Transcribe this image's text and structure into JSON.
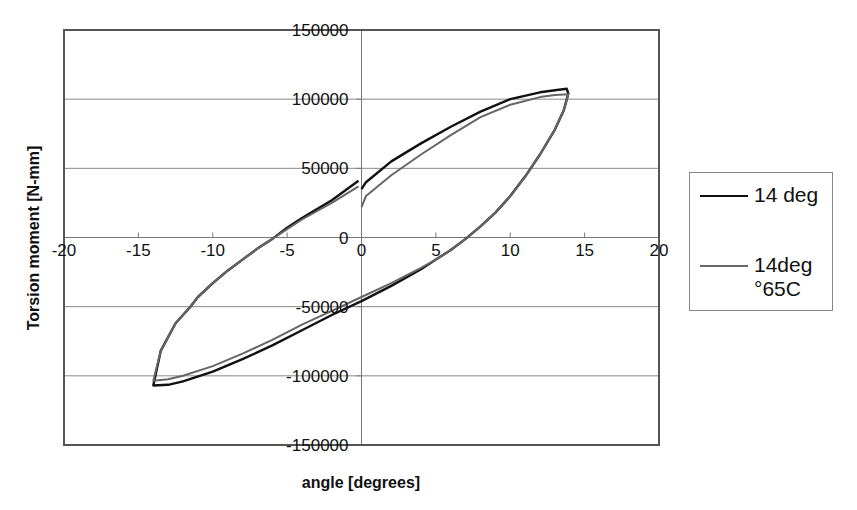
{
  "chart_data": {
    "type": "line",
    "title": "",
    "xlabel": "angle [degrees]",
    "ylabel": "Torsion moment [N-mm]",
    "xlim": [
      -20,
      20
    ],
    "ylim": [
      -150000,
      150000
    ],
    "x_ticks": [
      -20,
      -15,
      -10,
      -5,
      0,
      5,
      10,
      15,
      20
    ],
    "y_ticks": [
      150000,
      100000,
      50000,
      0,
      -50000,
      -100000,
      -150000
    ],
    "x_tick_labels": [
      "-20",
      "-15",
      "-10",
      "-5",
      "0",
      "5",
      "10",
      "15",
      "20"
    ],
    "y_tick_labels": [
      "150000",
      "100000",
      "50000",
      "0",
      "-50000",
      "-100000",
      "-150000"
    ],
    "grid": {
      "horizontal": true,
      "vertical": false
    },
    "axes_cross_at_origin": true,
    "legend_position": "right",
    "series": [
      {
        "name": "14 deg",
        "color": "#111111",
        "width": 2.4,
        "x": [
          0,
          0.3,
          2,
          4,
          6,
          8,
          10,
          12,
          13,
          13.8,
          13.9,
          13.6,
          13,
          12,
          11,
          10,
          9,
          8,
          7,
          6,
          5,
          4,
          2,
          0,
          -2,
          -4,
          -6,
          -8,
          -10,
          -12,
          -13,
          -14,
          -13.5,
          -12.5,
          -11.5,
          -11,
          -10,
          -9,
          -8,
          -7,
          -6,
          -5,
          -4,
          -2,
          -0.2
        ],
        "y": [
          35000,
          40000,
          55000,
          68000,
          80000,
          91000,
          100000,
          105000,
          106500,
          107500,
          104000,
          92000,
          78000,
          60000,
          44000,
          30000,
          18000,
          8000,
          -1000,
          -9000,
          -16000,
          -23000,
          -35000,
          -46000,
          -56000,
          -67000,
          -78000,
          -88000,
          -97000,
          -104000,
          -106500,
          -107000,
          -82000,
          -62000,
          -50000,
          -43000,
          -33000,
          -24000,
          -16000,
          -8000,
          -1000,
          7000,
          14000,
          27000,
          41000
        ]
      },
      {
        "name": "14deg °65C",
        "legend_lines": [
          "14deg",
          "°65C"
        ],
        "color": "#666666",
        "width": 2.0,
        "x": [
          0,
          0.3,
          2,
          4,
          6,
          8,
          10,
          12,
          13,
          13.9,
          13.6,
          13,
          12,
          11,
          10,
          9,
          8,
          7,
          6,
          5,
          4,
          2,
          0,
          -2,
          -4,
          -6,
          -8,
          -10,
          -12,
          -13,
          -14,
          -13.5,
          -12.5,
          -11.5,
          -11,
          -10,
          -9,
          -8,
          -7,
          -6,
          -5,
          -4,
          -2,
          -0.2
        ],
        "y": [
          22000,
          30000,
          45000,
          60000,
          74000,
          87000,
          96000,
          101500,
          103000,
          103500,
          92000,
          78000,
          60000,
          44000,
          30000,
          18000,
          8000,
          -1000,
          -9000,
          -16000,
          -22000,
          -33000,
          -43000,
          -53000,
          -63000,
          -74000,
          -84000,
          -93000,
          -100000,
          -102500,
          -103500,
          -82000,
          -62000,
          -50000,
          -43000,
          -33000,
          -24000,
          -16000,
          -8000,
          -1000,
          6000,
          13000,
          25000,
          37000
        ]
      }
    ]
  },
  "legend": {
    "items": [
      {
        "label_lines": [
          "14 deg"
        ],
        "color": "#111111"
      },
      {
        "label_lines": [
          "14deg",
          "°65C"
        ],
        "color": "#666666"
      }
    ]
  },
  "layout": {
    "plot": {
      "left": 64,
      "top": 30,
      "right": 659,
      "bottom": 445
    },
    "colors": {
      "frame": "#555555",
      "grid": "#888888",
      "axis": "#777777"
    }
  }
}
